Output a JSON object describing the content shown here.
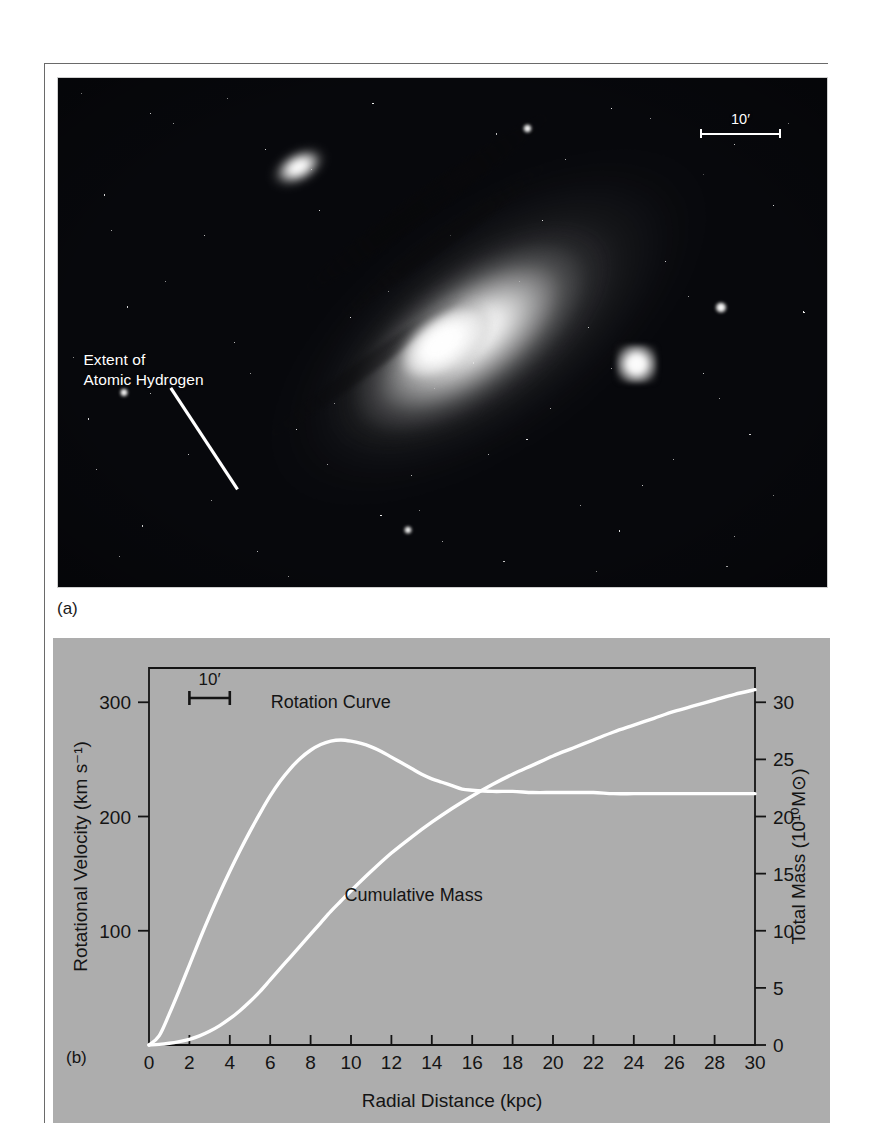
{
  "figure": {
    "panel_a": {
      "label": "(a)",
      "annotation_label": "Extent of\nAtomic Hydrogen",
      "annotation_line1": "Extent of",
      "annotation_line2": "Atomic Hydrogen",
      "scalebar_label": "10′",
      "objects": {
        "main_galaxy": "spiral-galaxy",
        "companion_upper_left": "companion-galaxy",
        "companion_lower_right": "companion-galaxy"
      }
    },
    "panel_b": {
      "label": "(b)",
      "scalebar_label": "10′"
    }
  },
  "chart_data": {
    "type": "line",
    "title": "",
    "xlabel": "Radial Distance (kpc)",
    "ylabel_left": "Rotational Velocity (km s⁻¹)",
    "ylabel_right": "Total Mass (10¹⁰M⊙)",
    "xlim": [
      0,
      30
    ],
    "ylim_left": [
      0,
      330
    ],
    "ylim_right": [
      0,
      33
    ],
    "xticks": [
      0,
      2,
      4,
      6,
      8,
      10,
      12,
      14,
      16,
      18,
      20,
      22,
      24,
      26,
      28,
      30
    ],
    "xticklabels": [
      "0",
      "2",
      "4",
      "6",
      "8",
      "10",
      "12",
      "14",
      "16",
      "18",
      "20",
      "22",
      "24",
      "26",
      "28",
      "30"
    ],
    "yticks_left": [
      100,
      200,
      300
    ],
    "yticklabels_left": [
      "100",
      "200",
      "300"
    ],
    "yticks_right": [
      0,
      5,
      10,
      15,
      20,
      25,
      30
    ],
    "yticklabels_right": [
      "0",
      "5",
      "10",
      "15",
      "20",
      "25",
      "30"
    ],
    "grid": false,
    "legend": "inline-annotations",
    "series": [
      {
        "name": "Rotation Curve",
        "axis": "left",
        "units": "km s^-1",
        "label_x": 9.0,
        "label_y": 295,
        "x": [
          0.0,
          0.5,
          1.0,
          1.5,
          2.0,
          2.5,
          3.0,
          3.5,
          4.0,
          4.5,
          5.0,
          5.5,
          6.0,
          6.5,
          7.0,
          7.5,
          8.0,
          8.5,
          9.0,
          9.5,
          10.0,
          10.5,
          11.0,
          11.5,
          12.0,
          12.5,
          13.0,
          13.5,
          14.0,
          14.5,
          15.0,
          15.5,
          16.0,
          17.0,
          18.0,
          19.0,
          20.0,
          21.0,
          22.0,
          23.0,
          24.0,
          25.0,
          26.0,
          27.0,
          28.0,
          29.0,
          30.0
        ],
        "y": [
          0,
          8,
          27,
          48,
          70,
          92,
          113,
          133,
          152,
          170,
          187,
          203,
          218,
          231,
          242,
          251,
          258,
          263,
          266,
          267,
          266,
          264,
          261,
          257,
          252,
          247,
          242,
          237,
          233,
          230,
          227,
          224,
          223,
          222,
          222,
          221,
          221,
          221,
          221,
          220,
          220,
          220,
          220,
          220,
          220,
          220,
          220
        ]
      },
      {
        "name": "Cumulative Mass",
        "axis": "right",
        "units": "10^10 Msun",
        "label_x": 13.1,
        "label_y": 12.6,
        "x": [
          0.0,
          0.5,
          1.0,
          1.5,
          2.0,
          2.5,
          3.0,
          3.5,
          4.0,
          4.5,
          5.0,
          5.5,
          6.0,
          6.5,
          7.0,
          7.5,
          8.0,
          8.5,
          9.0,
          9.5,
          10.0,
          11.0,
          12.0,
          13.0,
          14.0,
          15.0,
          16.0,
          17.0,
          18.0,
          19.0,
          20.0,
          21.0,
          22.0,
          23.0,
          24.0,
          25.0,
          26.0,
          27.0,
          28.0,
          29.0,
          30.0
        ],
        "y": [
          0.0,
          0.05,
          0.15,
          0.3,
          0.5,
          0.8,
          1.2,
          1.7,
          2.3,
          3.0,
          3.8,
          4.7,
          5.7,
          6.7,
          7.7,
          8.7,
          9.7,
          10.7,
          11.7,
          12.6,
          13.5,
          15.2,
          16.8,
          18.2,
          19.5,
          20.7,
          21.8,
          22.8,
          23.7,
          24.5,
          25.3,
          26.0,
          26.7,
          27.4,
          28.0,
          28.6,
          29.2,
          29.7,
          30.2,
          30.7,
          31.1
        ]
      }
    ],
    "annotations": [
      {
        "name": "rotation-curve-label",
        "text": "Rotation Curve"
      },
      {
        "name": "cumulative-mass-label",
        "text": "Cumulative Mass"
      },
      {
        "name": "angular-scalebar",
        "text": "10′",
        "from_kpc": 2,
        "to_kpc": 4
      }
    ],
    "colors": {
      "panel_background": "#adadad",
      "curve": "#ffffff",
      "axis": "#141414",
      "text": "#141414"
    }
  }
}
